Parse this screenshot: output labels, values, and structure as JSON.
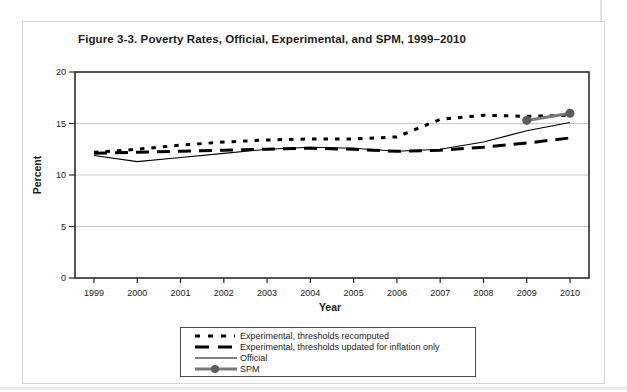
{
  "figure": {
    "title": "Figure 3-3. Poverty Rates, Official, Experimental, and SPM, 1999–2010"
  },
  "chart_data": {
    "type": "line",
    "title": "Figure 3-3. Poverty Rates, Official, Experimental, and SPM, 1999–2010",
    "xlabel": "Year",
    "ylabel": "Percent",
    "ylim": [
      0,
      20
    ],
    "yticks": [
      0,
      5,
      10,
      15,
      20
    ],
    "grid": "horizontal-light",
    "legend_position": "bottom-center",
    "categories": [
      "1999",
      "2000",
      "2001",
      "2002",
      "2003",
      "2004",
      "2005",
      "2006",
      "2007",
      "2008",
      "2009",
      "2010"
    ],
    "series": [
      {
        "name": "Experimental, thresholds recomputed",
        "style": "dotted",
        "color": "#000000",
        "values": [
          12.2,
          12.5,
          12.9,
          13.2,
          13.4,
          13.5,
          13.5,
          13.7,
          15.4,
          15.8,
          15.7,
          15.8
        ]
      },
      {
        "name": "Experimental, thresholds updated for inflation only",
        "style": "dashed",
        "color": "#000000",
        "values": [
          12.1,
          12.2,
          12.3,
          12.4,
          12.5,
          12.6,
          12.5,
          12.3,
          12.4,
          12.7,
          13.1,
          13.6
        ]
      },
      {
        "name": "Official",
        "style": "solid-thin",
        "color": "#000000",
        "values": [
          11.9,
          11.3,
          11.7,
          12.1,
          12.5,
          12.7,
          12.6,
          12.3,
          12.5,
          13.2,
          14.3,
          15.1
        ]
      },
      {
        "name": "SPM",
        "style": "solid-marker",
        "color": "#7a7a7a",
        "marker_color": "#5c5c5c",
        "values": [
          null,
          null,
          null,
          null,
          null,
          null,
          null,
          null,
          null,
          null,
          15.3,
          16.0
        ]
      }
    ]
  },
  "colors": {
    "axis": "#2b2b2b",
    "gridline": "#c9c9c9",
    "text": "#1c1c1c"
  }
}
